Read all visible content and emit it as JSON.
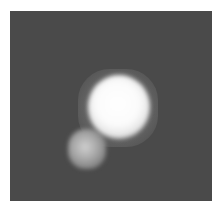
{
  "image": {
    "description": "Grayscale image showing a bright white blob with a smaller dimmer blob at its lower left, on a dark gray background",
    "colors": {
      "background": "#4a4a4a",
      "core": "#ffffff",
      "secondary_blob": "#b0b0b0",
      "border": "#ffffff"
    }
  }
}
